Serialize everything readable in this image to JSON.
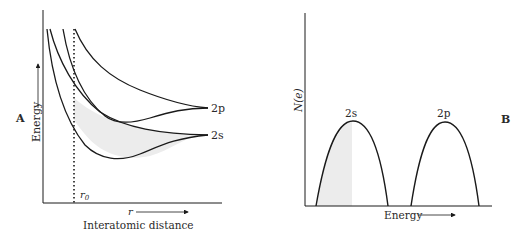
{
  "panel_a": {
    "panel_label": "A",
    "y_axis_label": "Energy",
    "x_axis_symbol": "r",
    "x_axis_label": "Interatomic distance",
    "equilibrium_label": "r",
    "equilibrium_subscript": "0",
    "level_labels": {
      "upper": "2p",
      "lower": "2s"
    }
  },
  "panel_b": {
    "panel_label": "B",
    "y_axis_label": "N(e)",
    "x_axis_label": "Energy",
    "band_labels": {
      "first": "2s",
      "second": "2p"
    }
  },
  "colors": {
    "line": "#1a1a1a",
    "shade": "#ececec",
    "text": "#2a2a2a"
  }
}
